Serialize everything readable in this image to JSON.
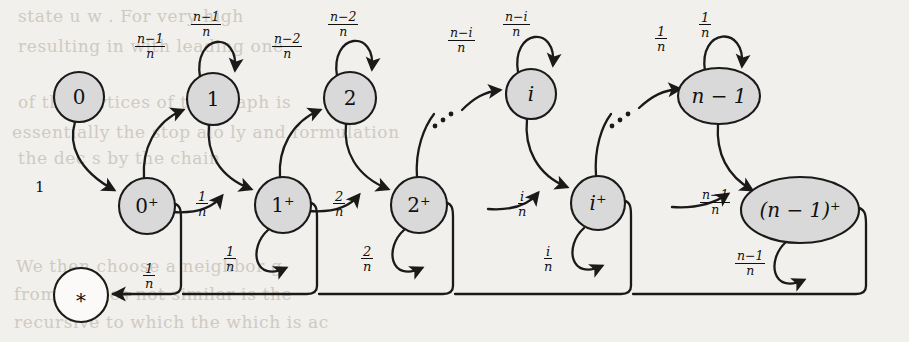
{
  "figure": {
    "kind": "markov-chain-state-diagram",
    "background_color": "#f2f0ec",
    "node_fill": "#d9d9d9",
    "node_fill_empty": "#fbfaf8",
    "stroke_color": "#1a1a1a"
  },
  "nodes": [
    {
      "id": "s0",
      "label": "0",
      "x": 79,
      "y": 97,
      "rx": 25,
      "ry": 25,
      "filled": true,
      "italic": false
    },
    {
      "id": "s1",
      "label": "1",
      "x": 213,
      "y": 99,
      "rx": 26,
      "ry": 26,
      "filled": true,
      "italic": false
    },
    {
      "id": "s2",
      "label": "2",
      "x": 350,
      "y": 98,
      "rx": 26,
      "ry": 26,
      "filled": true,
      "italic": false
    },
    {
      "id": "si",
      "label": "i",
      "x": 531,
      "y": 94,
      "rx": 25,
      "ry": 25,
      "filled": true,
      "italic": true
    },
    {
      "id": "sn1",
      "label": "n − 1",
      "x": 719,
      "y": 96,
      "rx": 41,
      "ry": 28,
      "filled": true,
      "italic": true
    },
    {
      "id": "s0p",
      "label": "0⁺",
      "x": 147,
      "y": 206,
      "rx": 28,
      "ry": 28,
      "filled": true,
      "italic": false
    },
    {
      "id": "s1p",
      "label": "1⁺",
      "x": 283,
      "y": 205,
      "rx": 28,
      "ry": 28,
      "filled": true,
      "italic": false
    },
    {
      "id": "s2p",
      "label": "2⁺",
      "x": 419,
      "y": 205,
      "rx": 28,
      "ry": 28,
      "filled": true,
      "italic": false
    },
    {
      "id": "sip",
      "label": "i⁺",
      "x": 598,
      "y": 203,
      "rx": 27,
      "ry": 27,
      "filled": true,
      "italic": true
    },
    {
      "id": "sn1p",
      "label": "(n − 1)⁺",
      "x": 800,
      "y": 210,
      "rx": 59,
      "ry": 33,
      "filled": true,
      "italic": true
    },
    {
      "id": "sstar",
      "label": "∗",
      "x": 81,
      "y": 295,
      "rx": 27,
      "ry": 27,
      "filled": false,
      "italic": false
    }
  ],
  "edge_labels": [
    {
      "id": "l-0-0p",
      "text": "1",
      "numerator": "1",
      "denominator": "",
      "x": 35,
      "y": 178,
      "kind": "plain"
    },
    {
      "id": "l-0p-1",
      "numerator": "n−1",
      "denominator": "n",
      "x": 135,
      "y": 33,
      "kind": "fraction",
      "wide": true
    },
    {
      "id": "l-1-self",
      "numerator": "n−1",
      "denominator": "n",
      "x": 191,
      "y": 11,
      "kind": "fraction",
      "wide": true
    },
    {
      "id": "l-1p-2",
      "numerator": "n−2",
      "denominator": "n",
      "x": 272,
      "y": 33,
      "kind": "fraction",
      "wide": true
    },
    {
      "id": "l-2-self",
      "numerator": "n−2",
      "denominator": "n",
      "x": 328,
      "y": 11,
      "kind": "fraction",
      "wide": true
    },
    {
      "id": "l-dots1-i",
      "numerator": "n−i",
      "denominator": "n",
      "x": 448,
      "y": 27,
      "kind": "fraction",
      "wide": true
    },
    {
      "id": "l-i-self",
      "numerator": "n−i",
      "denominator": "n",
      "x": 503,
      "y": 11,
      "kind": "fraction",
      "wide": true
    },
    {
      "id": "l-dots2-n1",
      "numerator": "1",
      "denominator": "n",
      "x": 655,
      "y": 25,
      "kind": "fraction"
    },
    {
      "id": "l-n1-self",
      "numerator": "1",
      "denominator": "n",
      "x": 699,
      "y": 11,
      "kind": "fraction"
    },
    {
      "id": "l-0p-1p",
      "numerator": "1",
      "denominator": "n",
      "x": 196,
      "y": 190,
      "kind": "fraction"
    },
    {
      "id": "l-1p-self",
      "numerator": "1",
      "denominator": "n",
      "x": 224,
      "y": 245,
      "kind": "fraction"
    },
    {
      "id": "l-1p-2p",
      "numerator": "2",
      "denominator": "n",
      "x": 333,
      "y": 190,
      "kind": "fraction"
    },
    {
      "id": "l-2p-self",
      "numerator": "2",
      "denominator": "n",
      "x": 361,
      "y": 245,
      "kind": "fraction"
    },
    {
      "id": "l-ip-in",
      "numerator": "i",
      "denominator": "n",
      "x": 518,
      "y": 190,
      "kind": "fraction"
    },
    {
      "id": "l-ip-self",
      "numerator": "i",
      "denominator": "n",
      "x": 544,
      "y": 245,
      "kind": "fraction"
    },
    {
      "id": "l-n1p-in",
      "numerator": "n−1",
      "denominator": "n",
      "x": 700,
      "y": 189,
      "kind": "fraction",
      "wide": true
    },
    {
      "id": "l-n1p-self",
      "numerator": "n−1",
      "denominator": "n",
      "x": 735,
      "y": 250,
      "kind": "fraction",
      "wide": true
    },
    {
      "id": "l-to-star",
      "numerator": "1",
      "denominator": "n",
      "x": 143,
      "y": 262,
      "kind": "fraction"
    }
  ],
  "ellipses_dots": [
    {
      "id": "dots-1",
      "points": [
        [
          435,
          126
        ],
        [
          443,
          120
        ],
        [
          451,
          114
        ]
      ]
    },
    {
      "id": "dots-2",
      "points": [
        [
          612,
          126
        ],
        [
          620,
          120
        ],
        [
          628,
          114
        ]
      ]
    }
  ],
  "background_text": [
    {
      "text": "state u  w   . For  very   high",
      "x": 18,
      "y": 6,
      "size": 17
    },
    {
      "text": "resulting  in   with leading one",
      "x": 18,
      "y": 36,
      "size": 17
    },
    {
      "text": "of  the  vertices  of  the graph is",
      "x": 18,
      "y": 92,
      "size": 17
    },
    {
      "text": "essentially  the  stop  alo   ly  and  formulation",
      "x": 12,
      "y": 122,
      "size": 17
    },
    {
      "text": "the  dec   s   by    the   chain",
      "x": 18,
      "y": 148,
      "size": 17
    },
    {
      "text": "We  then  choose  a neighbor  g",
      "x": 16,
      "y": 256,
      "size": 17
    },
    {
      "text": "from  at  does  not  similar  is  the",
      "x": 14,
      "y": 284,
      "size": 17
    },
    {
      "text": "recursive  to  which  the  which  is  ac",
      "x": 14,
      "y": 312,
      "size": 17
    }
  ]
}
